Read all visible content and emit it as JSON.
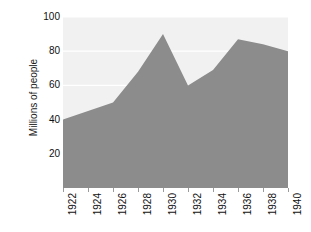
{
  "chart_data": {
    "type": "area",
    "title": "",
    "xlabel": "",
    "ylabel": "Millions of people",
    "categories": [
      1922,
      1924,
      1926,
      1928,
      1930,
      1932,
      1934,
      1936,
      1938,
      1940
    ],
    "x_tick_labels": [
      "1922",
      "1924",
      "1926",
      "1928",
      "1930",
      "1932",
      "1934",
      "1936",
      "1938",
      "1940"
    ],
    "values": [
      40,
      45,
      50,
      68,
      90,
      60,
      69,
      87,
      84,
      80
    ],
    "series": [
      {
        "name": "Millions of people",
        "values": [
          40,
          45,
          50,
          68,
          90,
          60,
          69,
          87,
          84,
          80
        ]
      }
    ],
    "xlim": [
      1922,
      1940
    ],
    "ylim": [
      0,
      100
    ],
    "y_tick_labels": [
      "100",
      "80",
      "60",
      "40",
      "20"
    ],
    "y_ticks": [
      100,
      80,
      60,
      40,
      20
    ],
    "grid": true,
    "grid_orientation": "horizontal",
    "grid_color": "#ffffff",
    "legend": false,
    "legend_position": "none",
    "area_color": "#8c8c8c",
    "plot_background": "#f1f1f1",
    "page_background": "#ffffff",
    "tick_color": "#9a9a9a",
    "text_color": "#111111"
  }
}
